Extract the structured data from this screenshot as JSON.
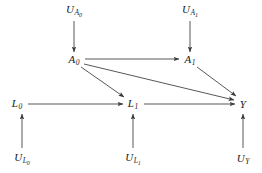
{
  "figure": {
    "type": "causal-dag",
    "background_color": "#ffffff",
    "edge_color": "#3a3a3a",
    "text_color": "#1a1a1a",
    "width": 262,
    "height": 173
  },
  "nodes": [
    {
      "id": "U_A0",
      "base": "U",
      "sub": "A",
      "subsub": "0",
      "x": 74,
      "y": 11,
      "label": "U_A0"
    },
    {
      "id": "U_A1",
      "base": "U",
      "sub": "A",
      "subsub": "1",
      "x": 190,
      "y": 11,
      "label": "U_A1"
    },
    {
      "id": "A0",
      "base": "A",
      "sub": "0",
      "subsub": "",
      "x": 74,
      "y": 60,
      "label": "A0"
    },
    {
      "id": "A1",
      "base": "A",
      "sub": "1",
      "subsub": "",
      "x": 190,
      "y": 60,
      "label": "A1"
    },
    {
      "id": "L0",
      "base": "L",
      "sub": "0",
      "subsub": "",
      "x": 17,
      "y": 104,
      "label": "L0"
    },
    {
      "id": "L1",
      "base": "L",
      "sub": "1",
      "subsub": "",
      "x": 133,
      "y": 104,
      "label": "L1"
    },
    {
      "id": "Y",
      "base": "Y",
      "sub": "",
      "subsub": "",
      "x": 243,
      "y": 104,
      "label": "Y"
    },
    {
      "id": "U_L0",
      "base": "U",
      "sub": "L",
      "subsub": "0",
      "x": 22,
      "y": 159,
      "label": "U_L0"
    },
    {
      "id": "U_L1",
      "base": "U",
      "sub": "L",
      "subsub": "1",
      "x": 133,
      "y": 159,
      "label": "U_L1"
    },
    {
      "id": "U_Y",
      "base": "U",
      "sub": "Y",
      "subsub": "",
      "x": 243,
      "y": 159,
      "label": "U_Y"
    }
  ],
  "edges": [
    {
      "id": "e1",
      "from": "U_A0",
      "to": "A0",
      "x1": 74,
      "y1": 21,
      "x2": 74,
      "y2": 52,
      "name": "edge-ua0-a0"
    },
    {
      "id": "e2",
      "from": "U_A1",
      "to": "A1",
      "x1": 190,
      "y1": 21,
      "x2": 190,
      "y2": 52,
      "name": "edge-ua1-a1"
    },
    {
      "id": "e3",
      "from": "A0",
      "to": "A1",
      "x1": 85,
      "y1": 59,
      "x2": 179,
      "y2": 59,
      "name": "edge-a0-a1"
    },
    {
      "id": "e4",
      "from": "A0",
      "to": "L1",
      "x1": 81,
      "y1": 67,
      "x2": 124,
      "y2": 97,
      "name": "edge-a0-l1"
    },
    {
      "id": "e5",
      "from": "A0",
      "to": "Y",
      "x1": 84,
      "y1": 64,
      "x2": 234,
      "y2": 100,
      "name": "edge-a0-y"
    },
    {
      "id": "e6",
      "from": "A1",
      "to": "Y",
      "x1": 197,
      "y1": 67,
      "x2": 236,
      "y2": 96,
      "name": "edge-a1-y"
    },
    {
      "id": "e7",
      "from": "L0",
      "to": "L1",
      "x1": 28,
      "y1": 104,
      "x2": 123,
      "y2": 104,
      "name": "edge-l0-l1"
    },
    {
      "id": "e8",
      "from": "L1",
      "to": "Y",
      "x1": 144,
      "y1": 104,
      "x2": 235,
      "y2": 104,
      "name": "edge-l1-y"
    },
    {
      "id": "e9",
      "from": "U_L0",
      "to": "L0",
      "x1": 22,
      "y1": 148,
      "x2": 22,
      "y2": 114,
      "name": "edge-ul0-l0"
    },
    {
      "id": "e10",
      "from": "U_L1",
      "to": "L1",
      "x1": 133,
      "y1": 148,
      "x2": 133,
      "y2": 114,
      "name": "edge-ul1-l1"
    },
    {
      "id": "e11",
      "from": "U_Y",
      "to": "Y",
      "x1": 243,
      "y1": 148,
      "x2": 243,
      "y2": 114,
      "name": "edge-uy-y"
    }
  ]
}
